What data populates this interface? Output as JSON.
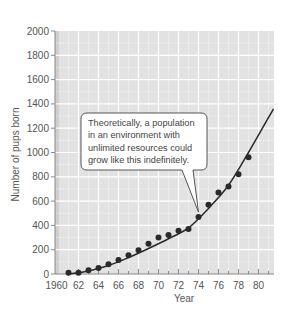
{
  "chart_data": {
    "type": "scatter",
    "title": "",
    "xlabel": "Year",
    "ylabel": "Number of pups born",
    "xlim": [
      1960,
      1981.5
    ],
    "ylim": [
      0,
      2000
    ],
    "x_tick_labels": [
      "1960",
      "62",
      "64",
      "66",
      "68",
      "70",
      "72",
      "74",
      "76",
      "78",
      "80"
    ],
    "x_ticks": [
      1960,
      1962,
      1964,
      1966,
      1968,
      1970,
      1972,
      1974,
      1976,
      1978,
      1980
    ],
    "y_ticks": [
      0,
      200,
      400,
      600,
      800,
      1000,
      1200,
      1400,
      1600,
      1800,
      2000
    ],
    "grid": true,
    "series": [
      {
        "name": "Observed pups born",
        "type": "scatter",
        "x": [
          1961,
          1962,
          1963,
          1964,
          1965,
          1966,
          1967,
          1968,
          1969,
          1970,
          1971,
          1972,
          1973,
          1974,
          1975,
          1976,
          1977,
          1978,
          1979
        ],
        "y": [
          10,
          10,
          30,
          50,
          80,
          115,
          155,
          195,
          250,
          300,
          320,
          355,
          370,
          470,
          570,
          670,
          720,
          820,
          960
        ]
      },
      {
        "name": "Exponential growth curve",
        "type": "line",
        "x": [
          1961,
          1963,
          1965,
          1967,
          1969,
          1971,
          1973,
          1975,
          1977,
          1979,
          1981.5
        ],
        "y": [
          0,
          25,
          70,
          135,
          210,
          290,
          380,
          540,
          730,
          1000,
          1360
        ]
      }
    ],
    "annotations": [
      {
        "text": "Theoretically, a population in an environment with unlimited resources could grow like this indefinitely.",
        "lines": [
          "Theoretically, a population",
          "in an environment with",
          "unlimited resources could",
          "grow like this indefinitely."
        ],
        "points_to": [
          1974,
          460
        ]
      }
    ],
    "colors": {
      "plot_background": "#e2e2e2",
      "grid": "#ffffff",
      "points": "#2a2a2a",
      "curve": "#2a2a2a",
      "callout_border": "#444444",
      "callout_fill": "#ffffff"
    }
  }
}
